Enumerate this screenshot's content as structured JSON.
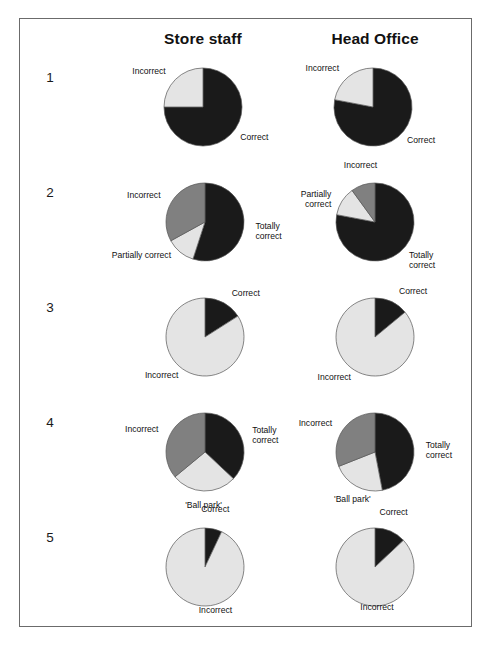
{
  "figure": {
    "columns": [
      {
        "id": "store-staff",
        "label": "Store staff"
      },
      {
        "id": "head-office",
        "label": "Head Office"
      }
    ],
    "row_numbers": [
      "1",
      "2",
      "3",
      "4",
      "5"
    ],
    "colors": {
      "black": "#1a1a1a",
      "dark_gray": "#808080",
      "light_gray": "#e4e4e4",
      "outline": "#555555",
      "frame": "#6b6b6b",
      "text": "#111111"
    }
  },
  "chart_data": [
    {
      "type": "pie",
      "id": "q1-store-staff",
      "row": "1",
      "column": "Store staff",
      "title": "",
      "start_angle": 0,
      "labels": [
        "Correct",
        "Incorrect"
      ],
      "values": [
        75,
        25
      ],
      "slice_colors": [
        "#1a1a1a",
        "#e4e4e4"
      ],
      "label_positions": [
        "right",
        "left"
      ]
    },
    {
      "type": "pie",
      "id": "q1-head-office",
      "row": "1",
      "column": "Head Office",
      "title": "",
      "start_angle": 0,
      "labels": [
        "Correct",
        "Incorrect"
      ],
      "values": [
        78,
        22
      ],
      "slice_colors": [
        "#1a1a1a",
        "#e4e4e4"
      ],
      "label_positions": [
        "right",
        "left"
      ]
    },
    {
      "type": "pie",
      "id": "q2-store-staff",
      "row": "2",
      "column": "Store staff",
      "title": "",
      "start_angle": 0,
      "labels": [
        "Totally\ncorrect",
        "Partially correct",
        "Incorrect"
      ],
      "values": [
        55,
        12,
        33
      ],
      "slice_colors": [
        "#1a1a1a",
        "#e4e4e4",
        "#808080"
      ],
      "label_positions": [
        "right",
        "left",
        "left"
      ]
    },
    {
      "type": "pie",
      "id": "q2-head-office",
      "row": "2",
      "column": "Head Office",
      "title": "",
      "start_angle": 0,
      "labels": [
        "Totally\ncorrect",
        "Partially\ncorrect",
        "Incorrect"
      ],
      "values": [
        78,
        12,
        10
      ],
      "slice_colors": [
        "#1a1a1a",
        "#e4e4e4",
        "#808080"
      ],
      "label_positions": [
        "right",
        "left",
        "top"
      ]
    },
    {
      "type": "pie",
      "id": "q3-store-staff",
      "row": "3",
      "column": "Store staff",
      "title": "",
      "start_angle": 0,
      "labels": [
        "Correct",
        "Incorrect"
      ],
      "values": [
        16,
        84
      ],
      "slice_colors": [
        "#1a1a1a",
        "#e4e4e4"
      ],
      "label_positions": [
        "right",
        "left"
      ]
    },
    {
      "type": "pie",
      "id": "q3-head-office",
      "row": "3",
      "column": "Head Office",
      "title": "",
      "start_angle": 0,
      "labels": [
        "Correct",
        "Incorrect"
      ],
      "values": [
        14,
        86
      ],
      "slice_colors": [
        "#1a1a1a",
        "#e4e4e4"
      ],
      "label_positions": [
        "right",
        "left"
      ]
    },
    {
      "type": "pie",
      "id": "q4-store-staff",
      "row": "4",
      "column": "Store staff",
      "title": "",
      "start_angle": 0,
      "labels": [
        "Totally\ncorrect",
        "'Ball park'",
        "Incorrect"
      ],
      "values": [
        37,
        27,
        36
      ],
      "slice_colors": [
        "#1a1a1a",
        "#e4e4e4",
        "#808080"
      ],
      "label_positions": [
        "right",
        "bottom",
        "left"
      ]
    },
    {
      "type": "pie",
      "id": "q4-head-office",
      "row": "4",
      "column": "Head Office",
      "title": "",
      "start_angle": 0,
      "labels": [
        "Totally\ncorrect",
        "'Ball park'",
        "Incorrect"
      ],
      "values": [
        47,
        22,
        31
      ],
      "slice_colors": [
        "#1a1a1a",
        "#e4e4e4",
        "#808080"
      ],
      "label_positions": [
        "right",
        "bottom",
        "left"
      ]
    },
    {
      "type": "pie",
      "id": "q5-store-staff",
      "row": "5",
      "column": "Store staff",
      "title": "",
      "start_angle": 0,
      "labels": [
        "Correct",
        "Incorrect"
      ],
      "values": [
        7,
        93
      ],
      "slice_colors": [
        "#1a1a1a",
        "#e4e4e4"
      ],
      "label_positions": [
        "top",
        "right"
      ]
    },
    {
      "type": "pie",
      "id": "q5-head-office",
      "row": "5",
      "column": "Head Office",
      "title": "",
      "start_angle": 0,
      "labels": [
        "Correct",
        "Incorrect"
      ],
      "values": [
        13,
        87
      ],
      "slice_colors": [
        "#1a1a1a",
        "#e4e4e4"
      ],
      "label_positions": [
        "top",
        "right"
      ]
    }
  ]
}
